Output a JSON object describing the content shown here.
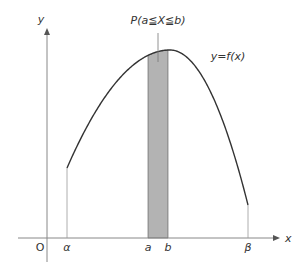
{
  "diagram": {
    "axes": {
      "x_label": "x",
      "y_label": "y",
      "origin_label": "O"
    },
    "curve_label": "y=f(x)",
    "region_label": "P(a≦X≦b)",
    "ticks": [
      {
        "id": "alpha",
        "label": "α"
      },
      {
        "id": "a",
        "label": "a"
      },
      {
        "id": "b",
        "label": "b"
      },
      {
        "id": "beta",
        "label": "β"
      }
    ],
    "colors": {
      "axis": "#888888",
      "curve": "#333333",
      "shaded_region": "#b3b3b3"
    }
  }
}
